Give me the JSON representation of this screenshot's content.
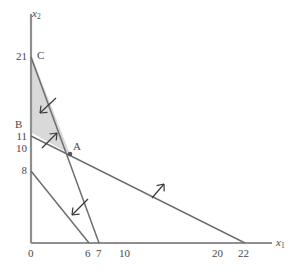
{
  "figure": {
    "type": "linear-programming-feasible-region",
    "axes": {
      "x_axis_label": "x",
      "x_axis_sub": "1",
      "y_axis_label": "x",
      "y_axis_sub": "2",
      "x_ticks": [
        {
          "value": 0,
          "label": "0"
        },
        {
          "value": 6,
          "label": "6"
        },
        {
          "value": 7,
          "label": "7"
        },
        {
          "value": 10,
          "label": "10"
        },
        {
          "value": 20,
          "label": "20"
        },
        {
          "value": 22,
          "label": "22"
        }
      ],
      "y_ticks": [
        {
          "value": 21,
          "label": "21"
        },
        {
          "value": 11,
          "label": "11"
        },
        {
          "value": 10,
          "label": "10"
        },
        {
          "value": 8,
          "label": "8"
        }
      ],
      "xlim": [
        0,
        27
      ],
      "ylim": [
        0,
        24
      ]
    },
    "point_labels": [
      {
        "name": "A",
        "label": "A",
        "x": 4.0,
        "y": 9.2
      },
      {
        "name": "B",
        "label": "B",
        "x": 0,
        "y": 12.4
      },
      {
        "name": "C",
        "label": "C",
        "x": 0,
        "y": 21
      }
    ],
    "constraint_lines": [
      {
        "name": "line-c-steep",
        "from": {
          "x": 0,
          "y": 21
        },
        "to": {
          "x": 7,
          "y": 0
        },
        "arrow_dir": "down-left"
      },
      {
        "name": "line-b-shallow",
        "from": {
          "x": 0,
          "y": 11
        },
        "to": {
          "x": 22,
          "y": 0
        },
        "arrow_dir": "up-right"
      },
      {
        "name": "line-lower",
        "from": {
          "x": 0,
          "y": 8
        },
        "to": {
          "x": 6,
          "y": 0
        },
        "arrow_dir": "down-left"
      }
    ],
    "feasible_region": {
      "name": "shaded-feasible-region",
      "vertices": [
        {
          "x": 0,
          "y": 21
        },
        {
          "x": 0,
          "y": 11
        },
        {
          "x": 4.0,
          "y": 9.2
        }
      ],
      "fill_color": "#d8d8d8"
    },
    "colors": {
      "axis": "#8c8c8c",
      "line": "#6e6e6e",
      "text": "#4a4a4a",
      "shade": "#d8d8d8",
      "arrow": "#3a3a3a"
    }
  }
}
